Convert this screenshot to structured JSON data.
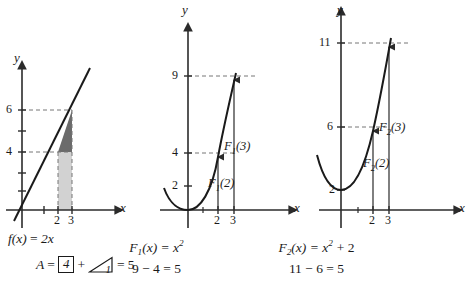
{
  "figure": {
    "axis_color": "#3a3a3a",
    "curve_color": "#1a1a1a",
    "dash_color": "#6e6e6e",
    "fill_dark": "#6b6b6b",
    "fill_light": "#d2d2d2"
  },
  "panels": [
    {
      "id": "panel-linear",
      "y_axis_label": "y",
      "x_axis_label": "x",
      "y_ticks": [
        "6",
        "4"
      ],
      "x_ticks": [
        "2",
        "3"
      ],
      "caption_line1": "f(x) = 2x",
      "caption_line2_parts": {
        "lead": "A  =",
        "boxed_value": "4",
        "plus": "+",
        "triangle_value": "1",
        "result": "=  5"
      },
      "function": "f(x) = 2x",
      "shaded_region": {
        "rectangle": {
          "x_from": 2,
          "x_to": 3,
          "y_from": 0,
          "y_to": 4,
          "area": 4
        },
        "triangle": {
          "x_from": 2,
          "x_to": 3,
          "y_from": 4,
          "y_to": 6,
          "area": 1
        }
      },
      "total_area": 5
    },
    {
      "id": "panel-F1",
      "y_axis_label": "y",
      "x_axis_label": "x",
      "y_ticks": [
        "9",
        "4",
        "2"
      ],
      "x_ticks": [
        "2",
        "3"
      ],
      "point_labels": [
        "F1(3)",
        "F1(2)"
      ],
      "caption_line1": "F1(x) = x2",
      "caption_line2": "9 − 4 = 5",
      "function": "F1(x) = x^2",
      "values": {
        "F1_of_2": 4,
        "F1_of_3": 9,
        "difference": 5
      }
    },
    {
      "id": "panel-F2",
      "y_axis_label": "y",
      "x_axis_label": "x",
      "y_ticks": [
        "11",
        "6",
        "2"
      ],
      "x_ticks": [
        "2",
        "3"
      ],
      "point_labels": [
        "F2(3)",
        "F2(2)"
      ],
      "caption_line1": "F2(x) = x2 + 2",
      "caption_line2": "11 − 6 = 5",
      "function": "F2(x) = x^2 + 2",
      "values": {
        "F2_of_2": 6,
        "F2_of_3": 11,
        "difference": 5
      }
    }
  ],
  "labels": {
    "y": "y",
    "x": "x",
    "p1_y6": "6",
    "p1_y4": "4",
    "p1_x2": "2",
    "p1_x3": "3",
    "p2_y9": "9",
    "p2_y4": "4",
    "p2_y2": "2",
    "p2_x2": "2",
    "p2_x3": "3",
    "p2_lab_hi_F": "F",
    "p2_lab_hi_sub": "1",
    "p2_lab_hi_arg": "(3)",
    "p2_lab_lo_F": "F",
    "p2_lab_lo_sub": "1",
    "p2_lab_lo_arg": "(2)",
    "p3_y11": "11",
    "p3_y6": "6",
    "p3_y2": "2",
    "p3_x2": "2",
    "p3_x3": "3",
    "p3_lab_hi_F": "F",
    "p3_lab_hi_sub": "2",
    "p3_lab_hi_arg": "(3)",
    "p3_lab_lo_F": "F",
    "p3_lab_lo_sub": "2",
    "p3_lab_lo_arg": "(2)",
    "cap1_fx": "f(x)",
    "cap1_eq": "=",
    "cap1_rhs": "2x",
    "cap1_A": "A",
    "cap1_eq2": "=",
    "cap1_box": "4",
    "cap1_plus": "+",
    "cap1_tri": "1",
    "cap1_eq3": "=",
    "cap1_five": "5",
    "cap2_F": "F",
    "cap2_sub": "1",
    "cap2_rest": "(x)  =  x",
    "cap2_exp": "2",
    "cap2_line2": "9 − 4 = 5",
    "cap3_F": "F",
    "cap3_sub": "2",
    "cap3_rest": "(x)  =  x",
    "cap3_exp": "2",
    "cap3_tail": "+ 2",
    "cap3_line2": "11 − 6 = 5"
  }
}
